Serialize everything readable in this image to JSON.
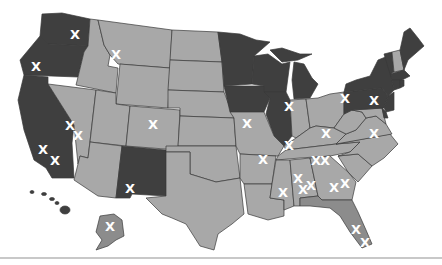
{
  "colors": {
    "dark": "#3f3f3f",
    "light": "#a8a8a8",
    "mid": "#8c8c8c",
    "border": "#3a3a3a",
    "marker": "#ffffff",
    "background": "#ffffff"
  },
  "legend": {
    "dark_meaning": "",
    "light_meaning": ""
  },
  "marker_glyph": "X",
  "states": [
    {
      "name": "WA",
      "shade": "dark"
    },
    {
      "name": "OR",
      "shade": "dark"
    },
    {
      "name": "CA",
      "shade": "dark"
    },
    {
      "name": "ID",
      "shade": "light"
    },
    {
      "name": "MT",
      "shade": "light"
    },
    {
      "name": "WY",
      "shade": "light"
    },
    {
      "name": "NV",
      "shade": "light"
    },
    {
      "name": "UT",
      "shade": "light"
    },
    {
      "name": "AZ",
      "shade": "light"
    },
    {
      "name": "CO",
      "shade": "light"
    },
    {
      "name": "NM",
      "shade": "dark"
    },
    {
      "name": "ND",
      "shade": "light"
    },
    {
      "name": "SD",
      "shade": "light"
    },
    {
      "name": "NE",
      "shade": "light"
    },
    {
      "name": "KS",
      "shade": "light"
    },
    {
      "name": "OK",
      "shade": "light"
    },
    {
      "name": "TX",
      "shade": "light"
    },
    {
      "name": "MN",
      "shade": "dark"
    },
    {
      "name": "IA",
      "shade": "dark"
    },
    {
      "name": "MO",
      "shade": "light"
    },
    {
      "name": "AR",
      "shade": "light"
    },
    {
      "name": "LA",
      "shade": "light"
    },
    {
      "name": "WI",
      "shade": "dark"
    },
    {
      "name": "IL",
      "shade": "dark"
    },
    {
      "name": "MI",
      "shade": "dark"
    },
    {
      "name": "IN",
      "shade": "light"
    },
    {
      "name": "OH",
      "shade": "light"
    },
    {
      "name": "KY",
      "shade": "light"
    },
    {
      "name": "TN",
      "shade": "light"
    },
    {
      "name": "MS",
      "shade": "light"
    },
    {
      "name": "AL",
      "shade": "light"
    },
    {
      "name": "GA",
      "shade": "light"
    },
    {
      "name": "FL",
      "shade": "mid"
    },
    {
      "name": "SC",
      "shade": "light"
    },
    {
      "name": "NC",
      "shade": "light"
    },
    {
      "name": "VA",
      "shade": "light"
    },
    {
      "name": "WV",
      "shade": "light"
    },
    {
      "name": "PA",
      "shade": "dark"
    },
    {
      "name": "NY",
      "shade": "dark"
    },
    {
      "name": "NJ",
      "shade": "dark"
    },
    {
      "name": "DE",
      "shade": "dark"
    },
    {
      "name": "MD",
      "shade": "light"
    },
    {
      "name": "CT",
      "shade": "dark"
    },
    {
      "name": "RI",
      "shade": "dark"
    },
    {
      "name": "MA",
      "shade": "dark"
    },
    {
      "name": "VT",
      "shade": "dark"
    },
    {
      "name": "NH",
      "shade": "light"
    },
    {
      "name": "ME",
      "shade": "dark"
    },
    {
      "name": "AK",
      "shade": "mid"
    },
    {
      "name": "HI",
      "shade": "dark"
    }
  ],
  "markers": [
    {
      "state": "WA",
      "x": 75,
      "y": 35
    },
    {
      "state": "OR",
      "x": 36,
      "y": 67
    },
    {
      "state": "MT",
      "x": 116,
      "y": 55
    },
    {
      "state": "NV",
      "x": 70,
      "y": 126
    },
    {
      "state": "NV",
      "x": 78,
      "y": 136
    },
    {
      "state": "CO",
      "x": 153,
      "y": 125
    },
    {
      "state": "CA",
      "x": 43,
      "y": 150
    },
    {
      "state": "CA",
      "x": 55,
      "y": 161
    },
    {
      "state": "NM",
      "x": 130,
      "y": 189
    },
    {
      "state": "AK",
      "x": 110,
      "y": 227
    },
    {
      "state": "MO",
      "x": 247,
      "y": 124
    },
    {
      "state": "IL",
      "x": 289,
      "y": 107
    },
    {
      "state": "IL",
      "x": 289,
      "y": 146
    },
    {
      "state": "PA",
      "x": 345,
      "y": 99
    },
    {
      "state": "PA",
      "x": 374,
      "y": 101
    },
    {
      "state": "KY",
      "x": 326,
      "y": 134
    },
    {
      "state": "VA",
      "x": 374,
      "y": 134
    },
    {
      "state": "AR",
      "x": 263,
      "y": 160
    },
    {
      "state": "TN",
      "x": 316,
      "y": 161
    },
    {
      "state": "TN",
      "x": 325,
      "y": 161
    },
    {
      "state": "MS",
      "x": 283,
      "y": 193
    },
    {
      "state": "AL",
      "x": 298,
      "y": 179
    },
    {
      "state": "AL",
      "x": 303,
      "y": 190
    },
    {
      "state": "AL",
      "x": 311,
      "y": 186
    },
    {
      "state": "GA",
      "x": 334,
      "y": 188
    },
    {
      "state": "GA",
      "x": 345,
      "y": 184
    },
    {
      "state": "FL",
      "x": 356,
      "y": 230
    },
    {
      "state": "FL",
      "x": 365,
      "y": 243
    }
  ]
}
